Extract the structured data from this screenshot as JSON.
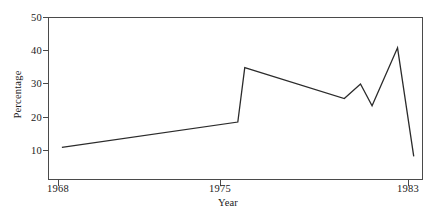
{
  "figure": {
    "background_color": "#ffffff",
    "line_color": "#2b2b2b",
    "axis_color": "#4a4a4a"
  },
  "axes": {
    "y_title": "Percentage",
    "x_title": "Year",
    "y_ticks": [
      {
        "label": "10",
        "value": 10
      },
      {
        "label": "20",
        "value": 20
      },
      {
        "label": "30",
        "value": 30
      },
      {
        "label": "40",
        "value": 40
      },
      {
        "label": "50",
        "value": 50
      }
    ],
    "x_ticks": [
      {
        "label": "1968",
        "value": 1968
      },
      {
        "label": "1975",
        "value": 1975
      },
      {
        "label": "1983",
        "value": 1983
      }
    ]
  },
  "chart_data": {
    "type": "line",
    "title": "",
    "xlabel": "Year",
    "ylabel": "Percentage",
    "xlim": [
      1967.6,
      1983.8
    ],
    "ylim": [
      5.0,
      50.0
    ],
    "grid": false,
    "legend": null,
    "x": [
      1968.2,
      1975.8,
      1976.1,
      1980.4,
      1981.1,
      1981.6,
      1982.7,
      1983.4
    ],
    "values": [
      14.0,
      21.0,
      36.0,
      27.5,
      31.5,
      25.5,
      41.5,
      11.5
    ],
    "series": [
      {
        "name": "Percentage",
        "points": [
          {
            "x": 1968.2,
            "y": 14.0
          },
          {
            "x": 1975.8,
            "y": 21.0
          },
          {
            "x": 1976.1,
            "y": 36.0
          },
          {
            "x": 1980.4,
            "y": 27.5
          },
          {
            "x": 1981.1,
            "y": 31.5
          },
          {
            "x": 1981.6,
            "y": 25.5
          },
          {
            "x": 1982.7,
            "y": 41.5
          },
          {
            "x": 1983.4,
            "y": 11.5
          }
        ]
      }
    ],
    "annotations": []
  }
}
